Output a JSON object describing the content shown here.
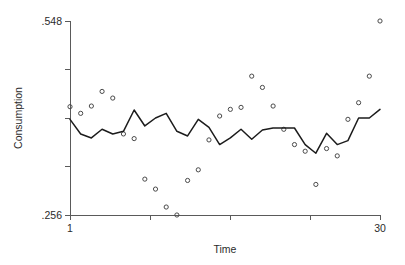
{
  "chart_data": {
    "type": "scatter",
    "title": "",
    "subtitle": "",
    "xlabel": "Time",
    "ylabel": "Consumption",
    "xlim": [
      1,
      30
    ],
    "ylim": [
      0.256,
      0.548
    ],
    "grid": false,
    "legend": null,
    "x_ticks": [
      1,
      8.5,
      16,
      23.5,
      30
    ],
    "x_tick_labels": [
      "1",
      "",
      "",
      "",
      "30"
    ],
    "y_ticks": [
      0.256,
      0.329,
      0.402,
      0.475,
      0.548
    ],
    "y_tick_labels": [
      ".256",
      "",
      "",
      "",
      ".548"
    ],
    "x": [
      1,
      2,
      3,
      4,
      5,
      6,
      7,
      8,
      9,
      10,
      11,
      12,
      13,
      14,
      15,
      16,
      17,
      18,
      19,
      20,
      21,
      22,
      23,
      24,
      25,
      26,
      27,
      28,
      29,
      30
    ],
    "series": [
      {
        "name": "Observed",
        "type": "scatter",
        "marker": "open-circle",
        "color": "#4a4a4a",
        "values": [
          0.419,
          0.409,
          0.42,
          0.442,
          0.432,
          0.378,
          0.371,
          0.31,
          0.295,
          0.268,
          0.256,
          0.308,
          0.324,
          0.369,
          0.405,
          0.415,
          0.418,
          0.465,
          0.448,
          0.42,
          0.385,
          0.362,
          0.352,
          0.302,
          0.356,
          0.345,
          0.4,
          0.425,
          0.465,
          0.548
        ]
      },
      {
        "name": "Fitted",
        "type": "line",
        "color": "#1c1c1c",
        "values": [
          0.4,
          0.378,
          0.372,
          0.385,
          0.378,
          0.382,
          0.414,
          0.39,
          0.402,
          0.409,
          0.382,
          0.375,
          0.4,
          0.388,
          0.362,
          0.372,
          0.385,
          0.37,
          0.384,
          0.387,
          0.387,
          0.387,
          0.362,
          0.349,
          0.379,
          0.362,
          0.368,
          0.402,
          0.402,
          0.415
        ]
      }
    ]
  }
}
